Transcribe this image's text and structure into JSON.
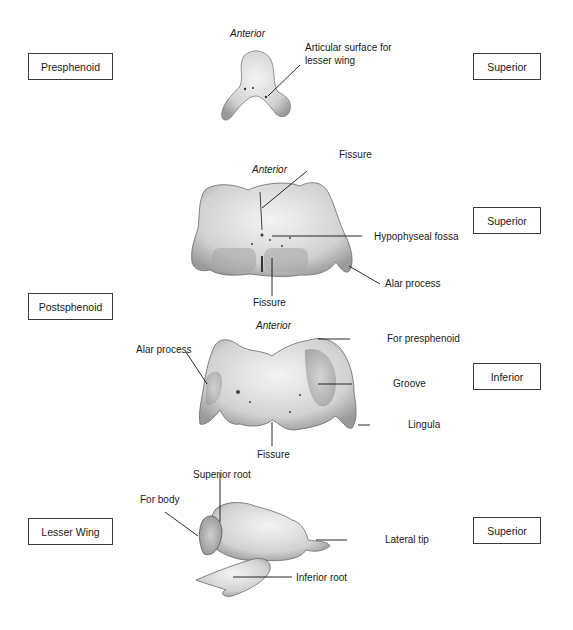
{
  "figure": {
    "sections": [
      {
        "name": "Presphenoid",
        "view": "Superior",
        "orientation": "Anterior",
        "labels": [
          "Articular surface for lesser wing"
        ]
      },
      {
        "name": "Postsphenoid",
        "views": [
          {
            "view": "Superior",
            "orientation": "Anterior",
            "labels": [
              "Fissure",
              "Hypophyseal fossa",
              "Fissure",
              "Alar process"
            ]
          },
          {
            "view": "Inferior",
            "orientation": "Anterior",
            "labels": [
              "Alar process",
              "For presphenoid",
              "Groove",
              "Lingula",
              "Fissure"
            ]
          }
        ]
      },
      {
        "name": "Lesser Wing",
        "view": "Superior",
        "labels": [
          "Superior root",
          "For body",
          "Lateral tip",
          "Inferior root"
        ]
      }
    ]
  },
  "boxes": {
    "presphenoid": "Presphenoid",
    "postsphenoid": "Postsphenoid",
    "lesser_wing": "Lesser Wing",
    "superior_1": "Superior",
    "superior_2": "Superior",
    "inferior": "Inferior",
    "superior_3": "Superior"
  },
  "labels": {
    "anterior_1": "Anterior",
    "articular_1": "Articular surface for",
    "articular_2": "lesser wing",
    "anterior_2": "Anterior",
    "fissure_top": "Fissure",
    "hypophyseal": "Hypophyseal fossa",
    "alar_1": "Alar process",
    "fissure_bottom_1": "Fissure",
    "anterior_3": "Anterior",
    "alar_2": "Alar process",
    "for_presphenoid": "For presphenoid",
    "groove": "Groove",
    "lingula": "Lingula",
    "fissure_bottom_2": "Fissure",
    "superior_root": "Superior root",
    "for_body": "For body",
    "lateral_tip": "Lateral tip",
    "inferior_root": "Inferior root"
  }
}
